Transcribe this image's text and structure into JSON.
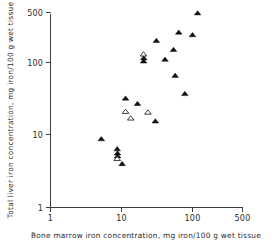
{
  "chart_data": {
    "type": "scatter",
    "title": "",
    "xlabel": "Bone marrow iron concentration, mg iron/100 g wet tissue",
    "ylabel": "Total liver iron concentration, mg iron/100 g wet tissue",
    "xscale": "log",
    "yscale": "log",
    "xlim": [
      1,
      500
    ],
    "ylim": [
      1,
      500
    ],
    "xticks": [
      1,
      10,
      100,
      500
    ],
    "xticklabels": [
      "1",
      "10",
      "100",
      "500"
    ],
    "yticks": [
      1,
      10,
      100,
      500
    ],
    "yticklabels": [
      "1",
      "10",
      "100",
      "500"
    ],
    "grid": false,
    "legend": null,
    "series": [
      {
        "name": "filled-triangle",
        "marker": "triangle-filled",
        "color": "#111111",
        "points": [
          {
            "x": 5.2,
            "y": 8.8
          },
          {
            "x": 8.7,
            "y": 6.4
          },
          {
            "x": 8.8,
            "y": 5.6
          },
          {
            "x": 8.8,
            "y": 5.1
          },
          {
            "x": 10.2,
            "y": 4.0
          },
          {
            "x": 11.4,
            "y": 32.0
          },
          {
            "x": 16.8,
            "y": 27.0
          },
          {
            "x": 20.5,
            "y": 104.0
          },
          {
            "x": 20.6,
            "y": 115.0
          },
          {
            "x": 30.0,
            "y": 15.5
          },
          {
            "x": 31.0,
            "y": 200.0
          },
          {
            "x": 41.0,
            "y": 110.0
          },
          {
            "x": 54.0,
            "y": 150.0
          },
          {
            "x": 57.0,
            "y": 66.0
          },
          {
            "x": 64.0,
            "y": 260.0
          },
          {
            "x": 78.0,
            "y": 37.0
          },
          {
            "x": 100.0,
            "y": 240.0
          },
          {
            "x": 118.0,
            "y": 480.0
          }
        ]
      },
      {
        "name": "open-triangle",
        "marker": "triangle-open",
        "color": "#ffffff",
        "points": [
          {
            "x": 8.7,
            "y": 4.7
          },
          {
            "x": 11.4,
            "y": 21.0
          },
          {
            "x": 13.5,
            "y": 17.0
          },
          {
            "x": 23.5,
            "y": 20.5
          },
          {
            "x": 20.4,
            "y": 130.0
          }
        ]
      }
    ]
  },
  "axes": {
    "x_title": "Bone marrow iron concentration, mg iron/100 g wet tissue",
    "y_title": "Total liver iron concentration, mg iron/100 g wet tissue",
    "x_tick_labels": [
      "1",
      "10",
      "100",
      "500"
    ],
    "y_tick_labels": [
      "1",
      "10",
      "100",
      "500"
    ]
  },
  "colors": {
    "axis": "#3d3d3d",
    "marker_fill": "#111111",
    "marker_open_fill": "#ffffff",
    "background": "#ffffff"
  }
}
